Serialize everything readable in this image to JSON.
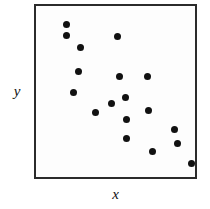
{
  "chart_data": {
    "type": "scatter",
    "title": "",
    "subtitle": "",
    "xlabel": "x",
    "ylabel": "y",
    "xlim": [
      0,
      100
    ],
    "ylim": [
      0,
      100
    ],
    "grid": false,
    "legend": null,
    "annotations": [],
    "marker": {
      "shape": "circle",
      "color": "#111111",
      "size_px": 7
    },
    "frame": {
      "border_color": "#2b2b2b",
      "background": "#fdfdfd"
    },
    "n_points": 18,
    "points": [
      {
        "x": 19,
        "y": 90
      },
      {
        "x": 19,
        "y": 83
      },
      {
        "x": 28,
        "y": 77
      },
      {
        "x": 50,
        "y": 83
      },
      {
        "x": 27,
        "y": 63
      },
      {
        "x": 23,
        "y": 51
      },
      {
        "x": 50,
        "y": 60
      },
      {
        "x": 68,
        "y": 60
      },
      {
        "x": 55,
        "y": 46
      },
      {
        "x": 46,
        "y": 50
      },
      {
        "x": 36,
        "y": 39
      },
      {
        "x": 69,
        "y": 39
      },
      {
        "x": 55,
        "y": 35
      },
      {
        "x": 85,
        "y": 28
      },
      {
        "x": 56,
        "y": 22
      },
      {
        "x": 87,
        "y": 20
      },
      {
        "x": 71,
        "y": 16
      },
      {
        "x": 95,
        "y": 9
      }
    ],
    "points_px": [
      {
        "x": 64,
        "y": 22
      },
      {
        "x": 64,
        "y": 33
      },
      {
        "x": 78,
        "y": 45
      },
      {
        "x": 115,
        "y": 34
      },
      {
        "x": 76,
        "y": 69
      },
      {
        "x": 71,
        "y": 90
      },
      {
        "x": 117,
        "y": 74
      },
      {
        "x": 145,
        "y": 74
      },
      {
        "x": 123,
        "y": 95
      },
      {
        "x": 109,
        "y": 101
      },
      {
        "x": 93,
        "y": 110
      },
      {
        "x": 146,
        "y": 108
      },
      {
        "x": 124,
        "y": 117
      },
      {
        "x": 172,
        "y": 127
      },
      {
        "x": 124,
        "y": 136
      },
      {
        "x": 175,
        "y": 141
      },
      {
        "x": 150,
        "y": 149
      },
      {
        "x": 189,
        "y": 161
      }
    ]
  }
}
